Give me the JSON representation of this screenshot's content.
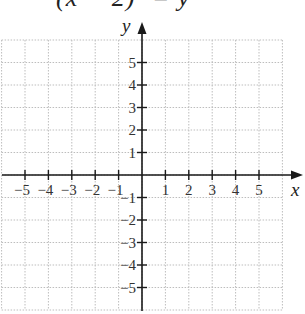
{
  "equation": {
    "text": "(x − 2)² = y",
    "clipped": true
  },
  "graph": {
    "x_axis_label": "x",
    "y_axis_label": "y",
    "x_range": [
      -6,
      6
    ],
    "y_range": [
      -6,
      6
    ],
    "x_tick_labels": [
      "−5",
      "−4",
      "−3",
      "−2",
      "−1",
      "1",
      "2",
      "3",
      "4",
      "5"
    ],
    "y_tick_labels": [
      "5",
      "4",
      "3",
      "2",
      "1",
      "−1",
      "−2",
      "−3",
      "−4",
      "−5"
    ],
    "grid": "dotted",
    "grid_color": "#bdbdbd",
    "axis_color": "#1a1a1a"
  }
}
